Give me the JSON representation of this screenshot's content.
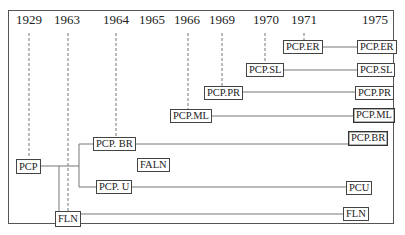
{
  "diagram": {
    "type": "genealogy-timeline",
    "years": [
      {
        "label": "1929",
        "x": 29
      },
      {
        "label": "1963",
        "x": 67
      },
      {
        "label": "1964",
        "x": 116
      },
      {
        "label": "1965",
        "x": 152
      },
      {
        "label": "1966",
        "x": 187
      },
      {
        "label": "1969",
        "x": 222
      },
      {
        "label": "1970",
        "x": 266
      },
      {
        "label": "1971",
        "x": 304
      },
      {
        "label": "1975",
        "x": 375
      }
    ],
    "nodes": {
      "pcp": "PCP",
      "fln_origin": "FLN",
      "pcp_br_origin": "PCP. BR",
      "pcp_u_origin": "PCP. U",
      "faln": "FALN",
      "pcp_ml_origin": "PCP.ML",
      "pcp_pr_origin": "PCP.PR",
      "pcp_sl_origin": "PCP.SL",
      "pcp_er_origin": "PCP.ER",
      "pcp_er_1975": "PCP.ER",
      "pcp_sl_1975": "PCP.SL",
      "pcp_pr_1975": "PCP.PR",
      "pcp_ml_1975": "PCP.ML",
      "pcp_br_1975": "PCP.BR",
      "pcu_1975": "PCU",
      "fln_1975": "FLN"
    }
  }
}
